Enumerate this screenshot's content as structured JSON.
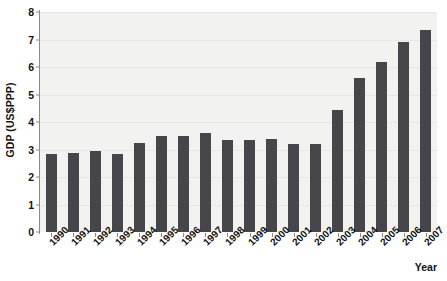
{
  "chart_data": {
    "type": "bar",
    "title": "",
    "xlabel": "Year",
    "ylabel": "GDP (US$PPP)",
    "categories": [
      "1990",
      "1991",
      "1992",
      "1993",
      "1994",
      "1995",
      "1996",
      "1997",
      "1998",
      "1999",
      "2000",
      "2001",
      "2002",
      "2003",
      "2004",
      "2005",
      "2006",
      "2007"
    ],
    "values": [
      2.85,
      2.87,
      2.95,
      2.82,
      3.25,
      3.5,
      3.5,
      3.6,
      3.35,
      3.35,
      3.4,
      3.2,
      3.2,
      4.45,
      5.6,
      6.2,
      6.9,
      7.35
    ],
    "ylim": [
      0,
      8
    ],
    "yticks": [
      0,
      1,
      2,
      3,
      4,
      5,
      6,
      7,
      8
    ],
    "ytick_labels": [
      "0",
      "1",
      "2",
      "3",
      "4",
      "5",
      "6",
      "7",
      "8"
    ],
    "grid": true,
    "legend": false,
    "legend_position": "none",
    "bar_color": "#46464a",
    "plot_background": "#f2f2f0",
    "axis_color": "#8b8b8b",
    "text_color": "#131313"
  }
}
